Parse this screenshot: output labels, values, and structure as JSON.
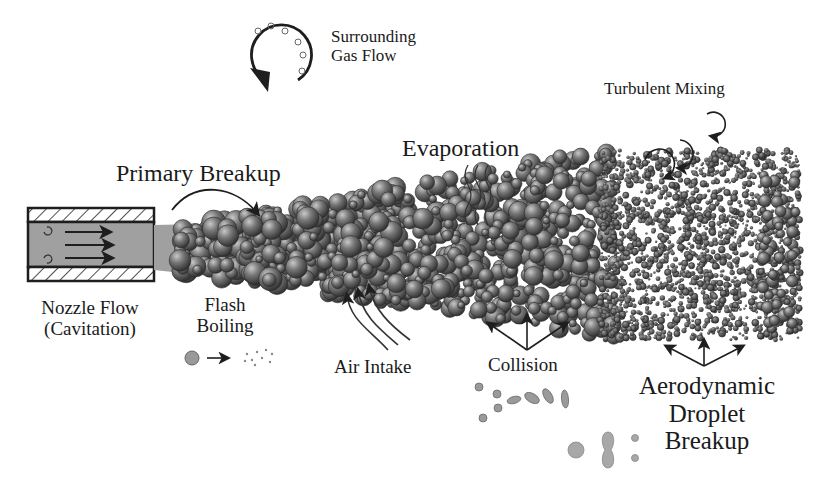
{
  "diagram": {
    "colors": {
      "background": "#ffffff",
      "liquid_core": "#a0a0a0",
      "droplet": "#6e6e6e",
      "droplet_dark": "#3c3c3c",
      "line": "#1e1e1e",
      "secondary_droplet": "#9a9a9a"
    },
    "labels": {
      "surrounding_gas_flow": [
        "Surrounding",
        "Gas Flow"
      ],
      "primary_breakup": "Primary Breakup",
      "evaporation": "Evaporation",
      "turbulent_mixing": "Turbulent Mixing",
      "nozzle_flow": [
        "Nozzle Flow",
        "(Cavitation)"
      ],
      "flash_boiling": [
        "Flash",
        "Boiling"
      ],
      "air_intake": "Air Intake",
      "collision": "Collision",
      "aerodynamic_breakup": [
        "Aerodynamic",
        "Droplet",
        "Breakup"
      ]
    },
    "icons": [
      "circular-arrow-icon",
      "nozzle-icon",
      "flow-arrow-icon",
      "curved-arrow-icon",
      "wavy-lines-icon",
      "swirl-arrow-icon",
      "three-arrows-icon",
      "flash-boiling-icon",
      "collision-sequence-icon",
      "droplet-breakup-sequence-icon"
    ]
  }
}
